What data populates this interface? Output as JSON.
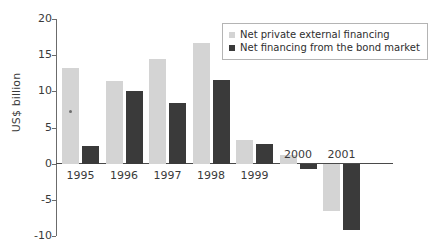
{
  "chart_data": {
    "type": "bar",
    "title": "",
    "subtitle": "",
    "xlabel": "",
    "ylabel": "US$ billion",
    "categories": [
      "1995",
      "1996",
      "1997",
      "1998",
      "1999",
      "2000",
      "2001"
    ],
    "series": [
      {
        "name": "Net private external financing",
        "color": "#d4d4d4",
        "values": [
          13.2,
          11.4,
          14.5,
          16.7,
          3.3,
          1.2,
          -6.5
        ]
      },
      {
        "name": "Net financing from the bond market",
        "color": "#3a3a3a",
        "values": [
          2.4,
          10.0,
          8.4,
          11.5,
          2.7,
          -0.8,
          -9.2
        ]
      }
    ],
    "ylim": [
      -10,
      20
    ],
    "yticks": [
      20,
      15,
      10,
      5,
      0,
      -5,
      -10
    ],
    "ytick_labels": [
      "20",
      "15",
      "10",
      "5",
      "0",
      "-5",
      "-10"
    ],
    "grid": false,
    "legend_position": "top-right",
    "zero_baseline": true,
    "annotations": []
  },
  "legend": {
    "items": [
      {
        "label": "Net private external financing",
        "swatch_color": "#d4d4d4"
      },
      {
        "label": "Net financing from the bond market",
        "swatch_color": "#3a3a3a"
      }
    ]
  },
  "axes": {
    "y_axis_title": "US$ billion"
  }
}
